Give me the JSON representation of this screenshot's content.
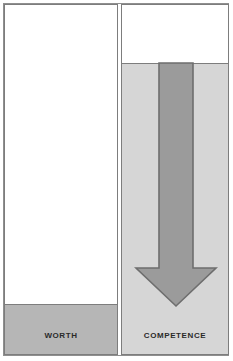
{
  "figure": {
    "type": "two-panel-comparison-diagram",
    "width": 233,
    "height": 361
  },
  "panels": [
    {
      "key": "worth",
      "label": "Worth",
      "fill_color": "#b6b6b6",
      "fill_from_top_pct": 85,
      "has_arrow": false
    },
    {
      "key": "competence",
      "label": "Competence",
      "fill_color": "#d6d6d6",
      "fill_from_top_pct": 17,
      "has_arrow": true
    }
  ],
  "arrow": {
    "name": "down-arrow",
    "direction": "down",
    "fill_color": "#9b9b9b",
    "stroke_color": "#6e6e6e"
  },
  "colors": {
    "background": "#ffffff",
    "border": "#7d7d7d",
    "frame": "#8f8f8f",
    "text": "#2a2a2a"
  }
}
